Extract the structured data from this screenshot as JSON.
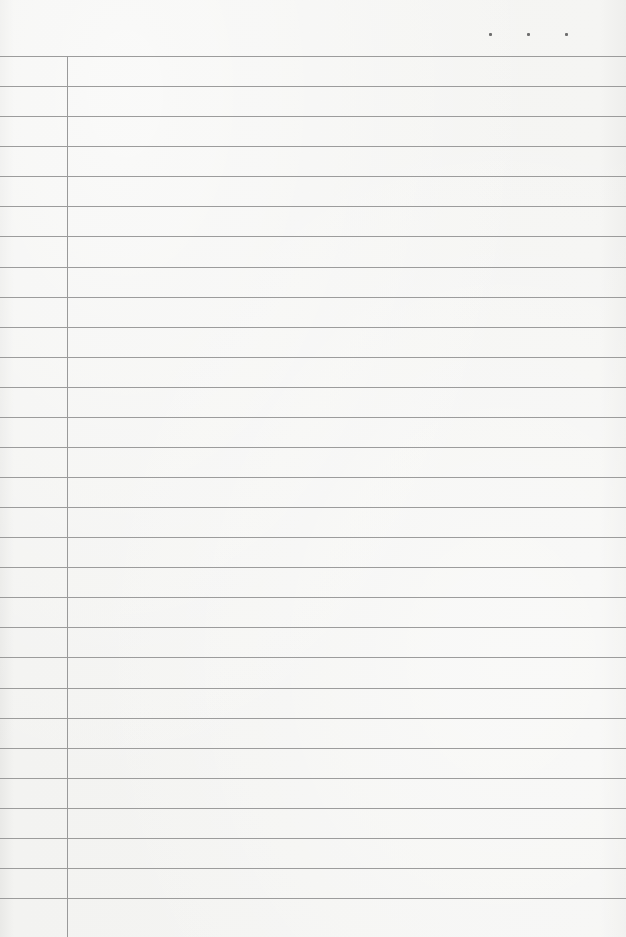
{
  "document": {
    "type": "lined-notebook-page",
    "content_text": "",
    "rule_count": 29,
    "date_marker": {
      "dots": 3
    }
  },
  "colors": {
    "paper": "#f2f2f0",
    "rule": "#8c8c8c",
    "margin": "#9a9a9a",
    "dot": "#6e6e6e"
  }
}
